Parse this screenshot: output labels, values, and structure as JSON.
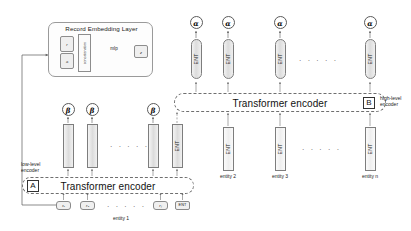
{
  "diagram": {
    "record_embedding_layer": {
      "title": "Record Embedding Layer",
      "input_top_label": "r",
      "input_bottom_label": "a",
      "concat_label": "concatenation",
      "mlp_label": "mlp",
      "output_label": "z"
    },
    "low_level": {
      "tag": "A",
      "caption_line1": "low-level",
      "caption_line2": "encoder",
      "encoder_label": "Transformer encoder",
      "entity_caption": "entity 1",
      "tokens": [
        {
          "label": "r₁"
        },
        {
          "label": "r₂"
        },
        {
          "label": "rⱼ"
        },
        {
          "label": "ENT"
        }
      ],
      "token_ellipsis": "· · · · ·",
      "outputs": [
        {
          "symbol": "β",
          "bar_label": ""
        },
        {
          "symbol": "β",
          "bar_label": ""
        },
        {
          "symbol": "β",
          "bar_label": ""
        }
      ],
      "ent_bar_label": "ENT",
      "output_ellipsis": "· · · · ·"
    },
    "high_level": {
      "tag": "B",
      "caption_line1": "high-level",
      "caption_line2": "encoder",
      "encoder_label": "Transformer encoder",
      "input_bars": [
        {
          "label": "ENT",
          "caption": ""
        },
        {
          "label": "ENT",
          "caption": "entity 2"
        },
        {
          "label": "ENT",
          "caption": "entity 3"
        },
        {
          "label": "ENT",
          "caption": "entity n"
        }
      ],
      "input_ellipsis": "· · · · ·",
      "outputs": [
        {
          "symbol": "α",
          "pill_label": "ENT"
        },
        {
          "symbol": "α",
          "pill_label": "ENT"
        },
        {
          "symbol": "α",
          "pill_label": "ENT"
        },
        {
          "symbol": "α",
          "pill_label": "ENT"
        }
      ],
      "output_ellipsis": "· · · · ·"
    },
    "colors": {
      "stroke": "#7d7d7d",
      "dashed": "#6f6f6f",
      "bar_fill": "#dcdcdc",
      "background": "#ffffff",
      "text": "#1a1a1a"
    }
  }
}
